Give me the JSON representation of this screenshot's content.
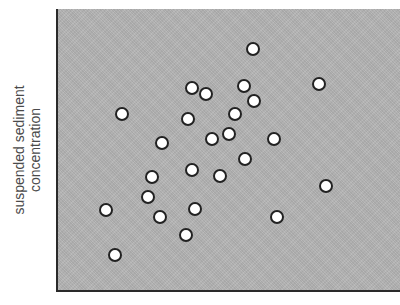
{
  "chart_data": {
    "type": "scatter",
    "title": "",
    "xlabel": "",
    "ylabel": "suspended sediment concentration",
    "ylabel_lines": [
      "suspended sediment",
      "concentration"
    ],
    "grid": false,
    "legend": null,
    "x_ticks": [],
    "y_ticks": [],
    "xlim": [
      0,
      100
    ],
    "ylim": [
      0,
      100
    ],
    "colors": {
      "plot_background": "#b4b4b4",
      "marker_fill": "#ffffff",
      "marker_edge": "#222222",
      "axis": "#2a2a2a",
      "label_text": "#4a4a4a"
    },
    "points": [
      {
        "x": 57.1,
        "y": 85.8
      },
      {
        "x": 39.4,
        "y": 72.0
      },
      {
        "x": 43.4,
        "y": 69.9
      },
      {
        "x": 54.5,
        "y": 72.7
      },
      {
        "x": 57.4,
        "y": 67.4
      },
      {
        "x": 76.4,
        "y": 73.4
      },
      {
        "x": 19.0,
        "y": 62.8
      },
      {
        "x": 38.2,
        "y": 61.0
      },
      {
        "x": 51.9,
        "y": 62.8
      },
      {
        "x": 30.6,
        "y": 52.5
      },
      {
        "x": 45.2,
        "y": 53.9
      },
      {
        "x": 50.1,
        "y": 55.7
      },
      {
        "x": 63.3,
        "y": 53.9
      },
      {
        "x": 54.8,
        "y": 46.8
      },
      {
        "x": 27.7,
        "y": 40.4
      },
      {
        "x": 39.4,
        "y": 42.9
      },
      {
        "x": 47.5,
        "y": 40.8
      },
      {
        "x": 78.4,
        "y": 37.2
      },
      {
        "x": 26.5,
        "y": 33.3
      },
      {
        "x": 14.3,
        "y": 28.7
      },
      {
        "x": 30.0,
        "y": 26.2
      },
      {
        "x": 40.2,
        "y": 29.1
      },
      {
        "x": 64.1,
        "y": 26.2
      },
      {
        "x": 37.6,
        "y": 19.9
      },
      {
        "x": 16.9,
        "y": 12.8
      }
    ]
  }
}
